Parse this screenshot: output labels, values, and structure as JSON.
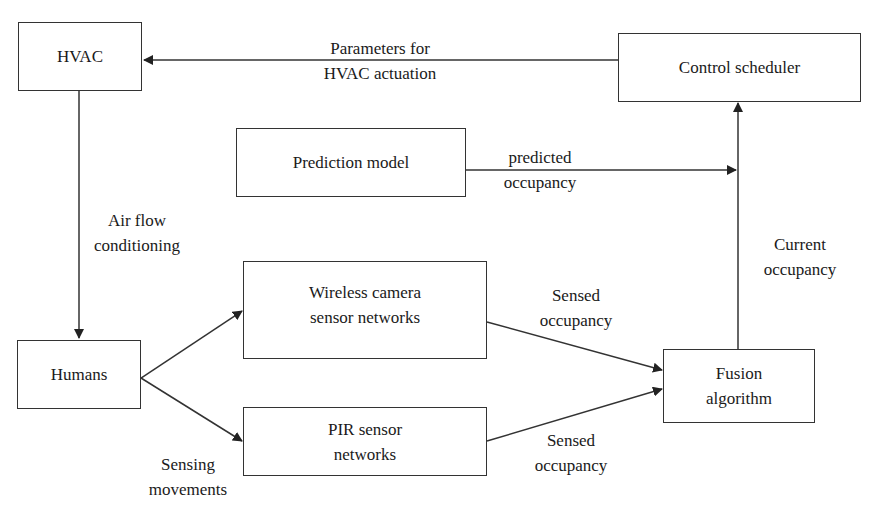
{
  "diagram": {
    "nodes": {
      "hvac": {
        "label": "HVAC"
      },
      "control_scheduler": {
        "label": "Control scheduler"
      },
      "prediction_model": {
        "label": "Prediction model"
      },
      "wireless_camera": {
        "line1": "Wireless camera",
        "line2": "sensor networks"
      },
      "pir": {
        "line1": "PIR sensor",
        "line2": "networks"
      },
      "humans": {
        "label": "Humans"
      },
      "fusion": {
        "line1": "Fusion",
        "line2": "algorithm"
      }
    },
    "edges": {
      "params_for_hvac": {
        "line1": "Parameters for",
        "line2": "HVAC actuation"
      },
      "predicted_occupancy": {
        "line1": "predicted",
        "line2": "occupancy"
      },
      "air_flow": {
        "line1": "Air flow",
        "line2": "conditioning"
      },
      "current_occupancy": {
        "line1": "Current",
        "line2": "occupancy"
      },
      "sensed_camera": {
        "line1": "Sensed",
        "line2": "occupancy"
      },
      "sensed_pir": {
        "line1": "Sensed",
        "line2": "occupancy"
      },
      "sensing_movements": {
        "line1": "Sensing",
        "line2": "movements"
      }
    },
    "colors": {
      "stroke": "#333333",
      "text": "#1a1a1a",
      "background": "#ffffff"
    }
  }
}
